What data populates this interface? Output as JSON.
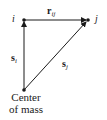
{
  "diagram": {
    "points": {
      "i": {
        "label": "i",
        "x": 24,
        "y": 20
      },
      "j": {
        "label": "j",
        "x": 88,
        "y": 20
      },
      "center": {
        "x": 24,
        "y": 90
      }
    },
    "vectors": {
      "r_ij": {
        "symbol": "r",
        "subscript": "ij",
        "from": "i",
        "to": "j"
      },
      "s_i": {
        "symbol": "s",
        "subscript": "i",
        "from": "center",
        "to": "i"
      },
      "s_j": {
        "symbol": "s",
        "subscript": "j",
        "from": "center",
        "to": "j"
      }
    },
    "caption": {
      "line1": "Center",
      "line2": "of mass"
    },
    "colors": {
      "ink": "#1a1a1a",
      "background": "#ffffff"
    }
  }
}
